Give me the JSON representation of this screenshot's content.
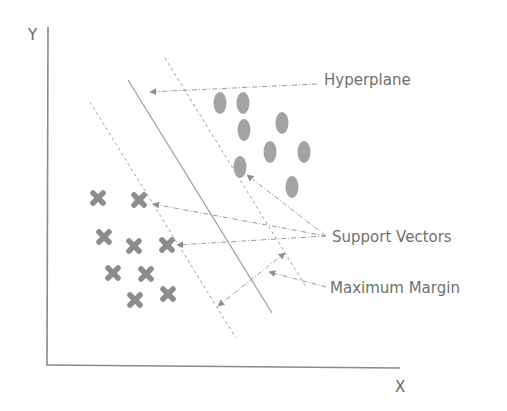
{
  "diagram": {
    "axes": {
      "x_label": "X",
      "y_label": "Y"
    },
    "labels": {
      "hyperplane": "Hyperplane",
      "support_vectors": "Support Vectors",
      "maximum_margin": "Maximum Margin"
    },
    "colors": {
      "axis": "#8a8a8a",
      "line": "#9a9a9a",
      "point": "#9e9e9e",
      "cross": "#8c8c8c",
      "arrow": "#8f8f8f",
      "text": "#6f6f6f"
    },
    "class_a_points": [
      {
        "x": 220,
        "y": 103
      },
      {
        "x": 243,
        "y": 103
      },
      {
        "x": 244,
        "y": 130
      },
      {
        "x": 282,
        "y": 123
      },
      {
        "x": 270,
        "y": 152
      },
      {
        "x": 304,
        "y": 152
      },
      {
        "x": 240,
        "y": 167
      },
      {
        "x": 292,
        "y": 187
      }
    ],
    "class_b_points": [
      {
        "x": 98,
        "y": 198
      },
      {
        "x": 139,
        "y": 200
      },
      {
        "x": 104,
        "y": 237
      },
      {
        "x": 134,
        "y": 246
      },
      {
        "x": 167,
        "y": 245
      },
      {
        "x": 113,
        "y": 273
      },
      {
        "x": 146,
        "y": 274
      },
      {
        "x": 135,
        "y": 300
      },
      {
        "x": 168,
        "y": 294
      }
    ]
  }
}
